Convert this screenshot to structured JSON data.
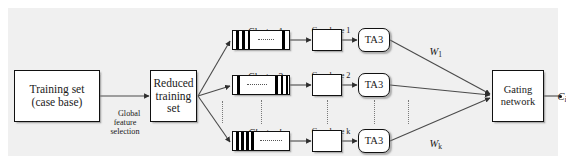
{
  "figure": {
    "background": "#f0f0f0",
    "line_color": "#3a3a3a",
    "node_fill": "#ffffff",
    "bar_color": "#000000"
  },
  "nodes": {
    "training_set": {
      "label": "Training set\n(case base)",
      "x": 14,
      "y": 70,
      "w": 86,
      "h": 52
    },
    "reduced_training_set": {
      "label": "Reduced\ntraining\nset",
      "x": 150,
      "y": 70,
      "w": 47,
      "h": 52
    },
    "gating_network": {
      "label": "Gating\nnetwork",
      "x": 492,
      "y": 70,
      "w": 52,
      "h": 52
    }
  },
  "edge_labels": {
    "global_feature_selection": "Global\nfeature\nselection",
    "output": "C",
    "output_sub": "i"
  },
  "rows": [
    {
      "id": "row-1",
      "cluster_label": "Cluster 1",
      "cluster_label_italic": false,
      "case_base_label": "Case base 1",
      "ta3_label": "TA3",
      "weight_label": "W",
      "weight_sub": "1",
      "y": 30
    },
    {
      "id": "row-2",
      "cluster_label": "Cluster 2",
      "cluster_label_italic": false,
      "case_base_label": "Case base 2",
      "ta3_label": "TA3",
      "weight_label": "",
      "weight_sub": "",
      "y": 75
    },
    {
      "id": "row-k",
      "cluster_label": "Cluster k",
      "cluster_label_italic": true,
      "case_base_label": "Case base k",
      "ta3_label": "TA3",
      "weight_label": "W",
      "weight_sub": "k",
      "y": 131
    }
  ],
  "geometry": {
    "cluster_x": 232,
    "cluster_w": 58,
    "cluster_h": 20,
    "casebase_x": 312,
    "casebase_w": 30,
    "casebase_h": 22,
    "ta3_x": 358,
    "ta3_w": 32,
    "ta3_h": 24
  }
}
